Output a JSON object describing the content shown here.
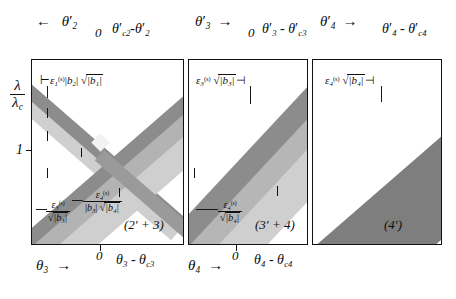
{
  "figure": {
    "background_color": "#ffffff",
    "ink_color": "#0d0d0d",
    "band_colors": {
      "dark": "#8e8e8e",
      "mid": "#b5b5b5",
      "light": "#d2d2d2",
      "solid_dark": "#808080"
    }
  },
  "axes": {
    "y_label_numerator": "λ",
    "y_label_denominator": "λ",
    "y_label_denominator_sub": "c",
    "y_tick_label": "1",
    "zero_label": "0"
  },
  "panels": [
    {
      "id": "panel-1",
      "tag": "(2′ + 3)",
      "top_left_axis": {
        "arrow": "←",
        "symbol": "θ",
        "sub": "2",
        "prime": "′"
      },
      "top_right_axis": {
        "zero": "0",
        "expression": "θ′_c2 − θ′_2",
        "parts": [
          {
            "symbol": "θ",
            "prime": "′",
            "sub": "c2"
          },
          {
            "op": "−"
          },
          {
            "symbol": "θ",
            "prime": "′",
            "sub": "2"
          }
        ]
      },
      "bottom_left_axis": {
        "symbol": "θ",
        "sub": "3",
        "arrow": "→"
      },
      "bottom_right_axis": {
        "zero": "0",
        "expression": "θ_3 − θ_c3",
        "parts": [
          {
            "symbol": "θ",
            "sub": "3"
          },
          {
            "op": "−"
          },
          {
            "symbol": "θ",
            "sub": "c3"
          }
        ]
      },
      "annotations": [
        {
          "name": "epsilon-1-width",
          "text": "ε₁^(s)|b₂| √|b₁|",
          "eps_sub": "1",
          "eps_sup": "(s)",
          "b_first_sub": "2",
          "b_root_sub": "1"
        },
        {
          "name": "epsilon-3-over-sqrt-b3",
          "numerator": "ε₃^(s)",
          "eps_sub": "3",
          "eps_sup": "(s)",
          "denominator": "√|b₃|",
          "b_sub": "3"
        },
        {
          "name": "epsilon-4-over-b3-sqrt-b4",
          "numerator": "ε₄^(s)",
          "eps_sub": "4",
          "eps_sup": "(s)",
          "denominator": "|b₃| √|b₄|",
          "b_first_sub": "3",
          "b_root_sub": "4"
        }
      ]
    },
    {
      "id": "panel-2",
      "tag": "(3′ + 4)",
      "top_left_axis": {
        "symbol": "θ",
        "sub": "3",
        "prime": "′",
        "arrow": "→"
      },
      "top_right_axis": {
        "zero": "0",
        "expression": "θ′_3 − θ′_c3",
        "parts": [
          {
            "symbol": "θ",
            "prime": "′",
            "sub": "3"
          },
          {
            "op": "−"
          },
          {
            "symbol": "θ",
            "prime": "′",
            "sub": "c3"
          }
        ]
      },
      "bottom_left_axis": {
        "symbol": "θ",
        "sub": "4",
        "arrow": "→"
      },
      "bottom_right_axis": {
        "zero": "0",
        "expression": "θ_4 − θ_c4",
        "parts": [
          {
            "symbol": "θ",
            "sub": "4"
          },
          {
            "op": "−"
          },
          {
            "symbol": "θ",
            "sub": "c4"
          }
        ]
      },
      "annotations": [
        {
          "name": "epsilon-3-width",
          "text": "ε₃^(s) √|b₃|",
          "eps_sub": "3",
          "eps_sup": "(s)",
          "b_root_sub": "3"
        },
        {
          "name": "epsilon-4-over-sqrt-b4",
          "numerator": "ε₄^(s)",
          "eps_sub": "4",
          "eps_sup": "(s)",
          "denominator": "√|b₄|",
          "b_sub": "4"
        }
      ]
    },
    {
      "id": "panel-3",
      "tag": "(4′)",
      "top_left_axis": {
        "symbol": "θ",
        "sub": "4",
        "prime": "′",
        "arrow": "→"
      },
      "top_right_axis": {
        "zero": "",
        "expression": "θ′_4 − θ′_c4",
        "parts": [
          {
            "symbol": "θ",
            "prime": "′",
            "sub": "4"
          },
          {
            "op": "−"
          },
          {
            "symbol": "θ",
            "prime": "′",
            "sub": "c4"
          }
        ]
      },
      "annotations": [
        {
          "name": "epsilon-4-width",
          "text": "ε₄^(s) √|b₄|",
          "eps_sub": "4",
          "eps_sup": "(s)",
          "b_root_sub": "4"
        }
      ]
    }
  ],
  "symbols": {
    "epsilon": "ε",
    "theta": "θ",
    "lambda": "λ",
    "sup_s": "(s)",
    "prime": "′",
    "minus": "-",
    "arrow_left": "←",
    "arrow_right": "→",
    "radical": "√",
    "abs_open": "|",
    "abs_close": "|",
    "b": "b",
    "zero": "0",
    "one": "1"
  }
}
